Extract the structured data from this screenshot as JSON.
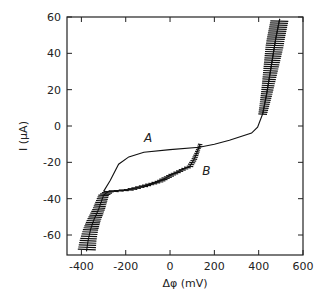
{
  "chart_data": {
    "type": "line",
    "title": "",
    "xlabel": "Δφ (mV)",
    "ylabel": "I (µA)",
    "xlim": [
      -465,
      600
    ],
    "ylim": [
      -71,
      60
    ],
    "xticks": [
      -400,
      -200,
      0,
      200,
      400,
      600
    ],
    "yticks": [
      60,
      40,
      20,
      0,
      -20,
      -40,
      -60
    ],
    "xtick_labels": [
      "-400",
      "-200",
      "0",
      "200",
      "400",
      "600"
    ],
    "ytick_labels": [
      "60",
      "40",
      "20",
      "0",
      "-20",
      "-40",
      "-60"
    ],
    "grid": false,
    "legend": "none",
    "annotations": [
      {
        "text": "A",
        "x": -118,
        "y": -9
      },
      {
        "text": "B",
        "x": 145,
        "y": -27
      }
    ],
    "series": [
      {
        "name": "A",
        "hatched": false,
        "points": [
          [
            -300,
            -36
          ],
          [
            -270,
            -30
          ],
          [
            -232,
            -21
          ],
          [
            -186,
            -17
          ],
          [
            -118,
            -14.4
          ],
          [
            0,
            -13
          ],
          [
            132,
            -11.7
          ],
          [
            200,
            -10
          ],
          [
            268,
            -7.8
          ],
          [
            368,
            -3.9
          ],
          [
            395,
            -0.6
          ],
          [
            418,
            6.7
          ],
          [
            436,
            17.8
          ],
          [
            455,
            31.7
          ],
          [
            477,
            48
          ],
          [
            495,
            59
          ]
        ]
      },
      {
        "name": "B",
        "hatched": true,
        "points": [
          [
            136,
            -10
          ],
          [
            110,
            -18
          ],
          [
            90,
            -22
          ],
          [
            20,
            -26
          ],
          [
            -50,
            -30.5
          ],
          [
            -120,
            -33
          ],
          [
            -186,
            -35
          ],
          [
            -277,
            -36
          ],
          [
            -300,
            -38
          ],
          [
            -323,
            -46
          ],
          [
            -345,
            -52
          ],
          [
            -359,
            -57
          ],
          [
            -370,
            -63
          ],
          [
            -377,
            -69
          ]
        ]
      },
      {
        "name": "upper-hatched-branch",
        "hatched": true,
        "points": [
          [
            418,
            6.7
          ],
          [
            436,
            17.8
          ],
          [
            455,
            31.7
          ],
          [
            477,
            48
          ],
          [
            495,
            59
          ]
        ]
      }
    ]
  }
}
